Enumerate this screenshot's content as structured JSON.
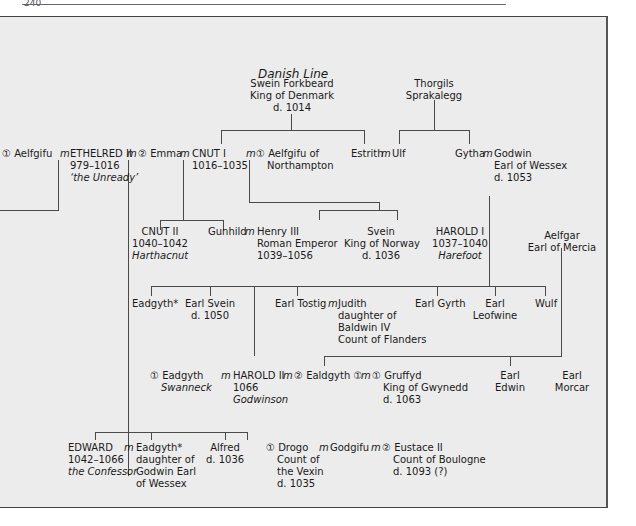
{
  "page": {
    "number": "240"
  },
  "diagram": {
    "title": "Danish Line",
    "people": {
      "swein_forkbeard": [
        "Swein Forkbeard",
        "King of Denmark",
        "d. 1014"
      ],
      "thorgils": [
        "Thorgils",
        "Sprakalegg"
      ],
      "aelfgifu1": "① Aelfgifu",
      "marriage": "m",
      "ethelred": [
        "ETHELRED II",
        "979–1016"
      ],
      "ethelred_epithet": "‘the Unready’",
      "emma": "② Emma",
      "cnut1": [
        "CNUT I",
        "1016–1035"
      ],
      "aelfgifu_n": [
        "① Aelfgifu of",
        "Northampton"
      ],
      "estrith": "Estrith",
      "ulf": "Ulf",
      "gytha": "Gytha",
      "godwin": [
        "Godwin",
        "Earl of Wessex",
        "d. 1053"
      ],
      "cnut2": [
        "CNUT II",
        "1040–1042"
      ],
      "cnut2_epithet": "Harthacnut",
      "gunhild": "Gunhild",
      "henry3": [
        "Henry III",
        "Roman Emperor",
        "1039–1056"
      ],
      "svein_norway": [
        "Svein",
        "King of Norway",
        "d. 1036"
      ],
      "harold1": [
        "HAROLD I",
        "1037–1040"
      ],
      "harold1_epithet": "Harefoot",
      "aelfgar": [
        "Aelfgar",
        "Earl of Mercia"
      ],
      "eadgyth_star": "Eadgyth*",
      "earl_svein": [
        "Earl Svein",
        "d. 1050"
      ],
      "earl_tostig": "Earl Tostig",
      "judith": [
        "Judith",
        "daughter of",
        "Baldwin IV",
        "Count of Flanders"
      ],
      "earl_gyrth": "Earl Gyrth",
      "earl_leofwine": [
        "Earl",
        "Leofwine"
      ],
      "wulf": "Wulf",
      "eadgyth_sw": "① Eadgyth",
      "eadgyth_sw_epithet": "Swanneck",
      "harold2": [
        "HAROLD II",
        "1066"
      ],
      "harold2_epithet": "Godwinson",
      "ealdgyth": "② Ealdgyth ①",
      "gruffyd": [
        "① Gruffyd",
        "King of Gwynedd",
        "d. 1063"
      ],
      "earl_edwin": [
        "Earl",
        "Edwin"
      ],
      "earl_morcar": [
        "Earl",
        "Morcar"
      ],
      "edward": [
        "EDWARD",
        "1042–1066"
      ],
      "edward_epithet": "the Confessor",
      "eadgyth_wife": [
        "Eadgyth*",
        "daughter of",
        "Godwin Earl",
        "of Wessex"
      ],
      "alfred": [
        "Alfred",
        "d. 1036"
      ],
      "drogo": [
        "① Drogo",
        "Count of",
        "the Vexin",
        "d. 1035"
      ],
      "godgifu": "Godgifu",
      "eustace": [
        "② Eustace II",
        "Count of Boulogne",
        "d. 1093 (?)"
      ]
    }
  }
}
